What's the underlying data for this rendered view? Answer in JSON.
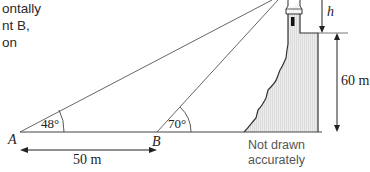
{
  "intro_text": {
    "line1": "ontally",
    "line2": "nt B,",
    "line3": "on"
  },
  "diagram": {
    "points": {
      "A": "A",
      "B": "B"
    },
    "angles": {
      "at_A": "48°",
      "at_B": "70°"
    },
    "lengths": {
      "AB": "50 m",
      "cliff_height": "60 m"
    },
    "unknown": "h",
    "note_line1": "Not drawn",
    "note_line2": "accurately",
    "colors": {
      "line": "#3a3a3a",
      "cliff_fill": "#e6e6e6",
      "text": "#222222",
      "note": "#555555"
    }
  }
}
